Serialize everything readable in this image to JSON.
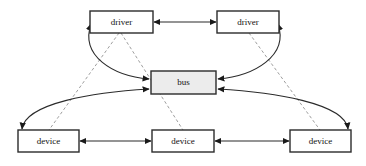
{
  "diagram": {
    "canvas": {
      "width": 366,
      "height": 166,
      "background": "#ffffff"
    },
    "style": {
      "node_stroke": "#2b2b2b",
      "node_fill_plain": "#ffffff",
      "node_fill_bus": "#ececec",
      "edge_solid_color": "#2b2b2b",
      "edge_dashed_color": "#8c8c8c",
      "label_color": "#111111"
    },
    "nodes": [
      {
        "id": "driver-left",
        "label": "driver",
        "x": 90,
        "y": 11,
        "width": 63,
        "height": 22,
        "fill": "#ffffff"
      },
      {
        "id": "driver-right",
        "label": "driver",
        "x": 217,
        "y": 11,
        "width": 62,
        "height": 22,
        "fill": "#ffffff"
      },
      {
        "id": "bus",
        "label": "bus",
        "x": 151,
        "y": 71,
        "width": 65,
        "height": 23,
        "fill": "#ececec"
      },
      {
        "id": "device-left",
        "label": "device",
        "x": 18,
        "y": 130,
        "width": 61,
        "height": 22,
        "fill": "#ffffff"
      },
      {
        "id": "device-middle",
        "label": "device",
        "x": 152,
        "y": 130,
        "width": 62,
        "height": 22,
        "fill": "#ffffff"
      },
      {
        "id": "device-right",
        "label": "device",
        "x": 290,
        "y": 130,
        "width": 61,
        "height": 22,
        "fill": "#ffffff"
      }
    ],
    "edges": [
      {
        "id": "driver-left-to-driver-right",
        "from": "driver-left",
        "to": "driver-right",
        "style": "solid",
        "arrows": "both"
      },
      {
        "id": "device-left-to-device-middle",
        "from": "device-left",
        "to": "device-middle",
        "style": "solid",
        "arrows": "both"
      },
      {
        "id": "device-middle-to-device-right",
        "from": "device-middle",
        "to": "device-right",
        "style": "solid",
        "arrows": "both"
      },
      {
        "id": "driver-left-to-bus",
        "from": "driver-left",
        "to": "bus",
        "style": "solid",
        "arrows": "both"
      },
      {
        "id": "driver-right-to-bus",
        "from": "driver-right",
        "to": "bus",
        "style": "solid",
        "arrows": "both"
      },
      {
        "id": "bus-to-device-left",
        "from": "bus",
        "to": "device-left",
        "style": "solid",
        "arrows": "both"
      },
      {
        "id": "bus-to-device-right",
        "from": "bus",
        "to": "device-right",
        "style": "solid",
        "arrows": "both"
      },
      {
        "id": "driver-left-binds-device-left",
        "from": "driver-left",
        "to": "device-left",
        "style": "dashed",
        "arrows": "none"
      },
      {
        "id": "driver-left-binds-device-middle",
        "from": "driver-left",
        "to": "device-middle",
        "style": "dashed",
        "arrows": "none"
      },
      {
        "id": "driver-right-binds-device-right",
        "from": "driver-right",
        "to": "device-right",
        "style": "dashed",
        "arrows": "none"
      }
    ]
  }
}
